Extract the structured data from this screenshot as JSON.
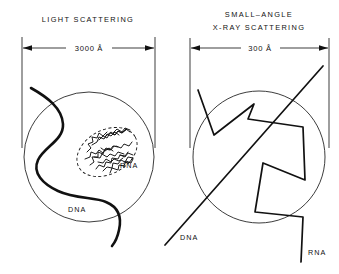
{
  "figure": {
    "background_color": "#ffffff",
    "ink_color": "#111111"
  },
  "panels": [
    {
      "id": "light-scattering",
      "title_lines": [
        "LIGHT  SCATTERING"
      ],
      "dimension": {
        "value": "3000",
        "unit": "Å",
        "label": "3000 Å"
      },
      "labels": {
        "dna": "DNA",
        "rna": "RNA"
      }
    },
    {
      "id": "small-angle-x-ray-scattering",
      "title_lines": [
        "SMALL–ANGLE",
        "X-RAY  SCATTERING"
      ],
      "dimension": {
        "value": "300",
        "unit": "Å",
        "label": "300 Å"
      },
      "labels": {
        "dna": "DNA",
        "rna": "RNA"
      }
    }
  ]
}
